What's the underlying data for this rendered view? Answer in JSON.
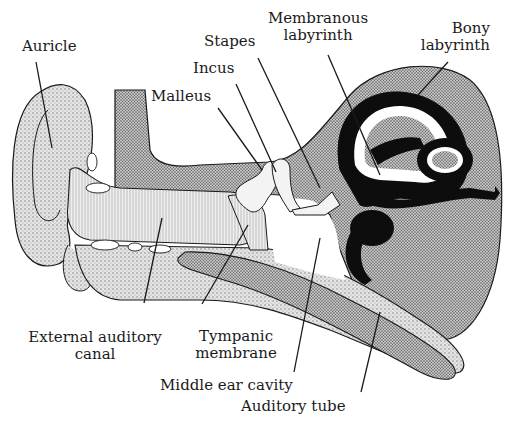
{
  "colors": {
    "ink": "#1a1a1a",
    "stipple_light": "#d9d9d9",
    "stipple_mid": "#bdbdbd",
    "stipple_dark": "#9a9a9a",
    "membranous": "#0d0d0d",
    "background": "#ffffff"
  },
  "labels": {
    "auricle": "Auricle",
    "stapes": "Stapes",
    "incus": "Incus",
    "malleus": "Malleus",
    "membranous_labyrinth_1": "Membranous",
    "membranous_labyrinth_2": "labyrinth",
    "bony_labyrinth_1": "Bony",
    "bony_labyrinth_2": "labyrinth",
    "external_auditory_canal_1": "External auditory",
    "external_auditory_canal_2": "canal",
    "tympanic_membrane_1": "Tympanic",
    "tympanic_membrane_2": "membrane",
    "middle_ear_cavity": "Middle ear cavity",
    "auditory_tube": "Auditory tube"
  }
}
